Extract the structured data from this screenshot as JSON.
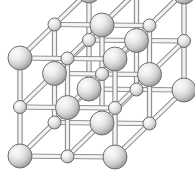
{
  "figure": {
    "name": "rock-salt-crystal-lattice",
    "type": "ball-and-stick-crystal-lattice",
    "title": "",
    "caption": "",
    "width": 195,
    "height": 177,
    "background_color": "#ffffff"
  },
  "projection": {
    "origin_x": 20.0,
    "origin_y": 156.0,
    "axis_x": {
      "dx": 47.5,
      "dy": 0.5
    },
    "axis_y": {
      "dx": 0.0,
      "dy": -49.0
    },
    "axis_z": {
      "dx": 34.5,
      "dy": -33.5
    },
    "cells_per_edge": 2,
    "nodes_per_edge": 3
  },
  "atoms": {
    "large": {
      "label": "large-atom",
      "radius": 12.0,
      "fill_center_color": "#f2f2f2",
      "fill_edge_color": "#9d9d9d",
      "stroke_color": "#6f6f6f",
      "stroke_width": 1.0,
      "highlight_offset_x": -0.32,
      "highlight_offset_y": -0.34,
      "count": 14
    },
    "small": {
      "label": "small-atom",
      "radius": 6.5,
      "fill_center_color": "#f2f2f2",
      "fill_edge_color": "#a5a5a5",
      "stroke_color": "#6f6f6f",
      "stroke_width": 1.0,
      "highlight_offset_x": -0.32,
      "highlight_offset_y": -0.34,
      "count": 13
    },
    "parity_rule": "large when (i+j+k) is even, small when (i+j+k) is odd"
  },
  "bonds": {
    "label": "bond-rod",
    "style": "double-line-cylinder",
    "width": 5.2,
    "fill_color": "#e8e8e8",
    "core_color": "#f6f6f6",
    "stroke_color": "#7c7c7c",
    "stroke_width": 0.9,
    "count": 54
  },
  "legend": {
    "visible": false,
    "items": []
  },
  "labels": {
    "visible": false,
    "items": []
  },
  "chart_data": {
    "type": "scatter",
    "title": "",
    "xlabel": "",
    "ylabel": "",
    "grid": false,
    "legend_position": "none",
    "lattice_dimensions": [
      3,
      3,
      3
    ],
    "site_count": 27,
    "large_sphere_count": 14,
    "small_sphere_count": 13,
    "bond_count": 54,
    "sites": [
      {
        "i": 0,
        "j": 0,
        "k": 0,
        "kind": "large"
      },
      {
        "i": 1,
        "j": 0,
        "k": 0,
        "kind": "small"
      },
      {
        "i": 2,
        "j": 0,
        "k": 0,
        "kind": "large"
      },
      {
        "i": 0,
        "j": 1,
        "k": 0,
        "kind": "small"
      },
      {
        "i": 1,
        "j": 1,
        "k": 0,
        "kind": "large"
      },
      {
        "i": 2,
        "j": 1,
        "k": 0,
        "kind": "small"
      },
      {
        "i": 0,
        "j": 2,
        "k": 0,
        "kind": "large"
      },
      {
        "i": 1,
        "j": 2,
        "k": 0,
        "kind": "small"
      },
      {
        "i": 2,
        "j": 2,
        "k": 0,
        "kind": "large"
      },
      {
        "i": 0,
        "j": 0,
        "k": 1,
        "kind": "small"
      },
      {
        "i": 1,
        "j": 0,
        "k": 1,
        "kind": "large"
      },
      {
        "i": 2,
        "j": 0,
        "k": 1,
        "kind": "small"
      },
      {
        "i": 0,
        "j": 1,
        "k": 1,
        "kind": "large"
      },
      {
        "i": 1,
        "j": 1,
        "k": 1,
        "kind": "small"
      },
      {
        "i": 2,
        "j": 1,
        "k": 1,
        "kind": "large"
      },
      {
        "i": 0,
        "j": 2,
        "k": 1,
        "kind": "small"
      },
      {
        "i": 1,
        "j": 2,
        "k": 1,
        "kind": "large"
      },
      {
        "i": 2,
        "j": 2,
        "k": 1,
        "kind": "small"
      },
      {
        "i": 0,
        "j": 0,
        "k": 2,
        "kind": "large"
      },
      {
        "i": 1,
        "j": 0,
        "k": 2,
        "kind": "small"
      },
      {
        "i": 2,
        "j": 0,
        "k": 2,
        "kind": "large"
      },
      {
        "i": 0,
        "j": 1,
        "k": 2,
        "kind": "small"
      },
      {
        "i": 1,
        "j": 1,
        "k": 2,
        "kind": "large"
      },
      {
        "i": 2,
        "j": 1,
        "k": 2,
        "kind": "small"
      },
      {
        "i": 0,
        "j": 2,
        "k": 2,
        "kind": "large"
      },
      {
        "i": 1,
        "j": 2,
        "k": 2,
        "kind": "small"
      },
      {
        "i": 2,
        "j": 2,
        "k": 2,
        "kind": "large"
      }
    ]
  }
}
